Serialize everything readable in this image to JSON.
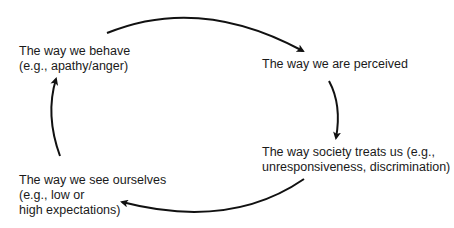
{
  "diagram": {
    "type": "cycle",
    "nodes": [
      {
        "id": "behave",
        "lines": [
          "The way we behave",
          "(e.g., apathy/anger)"
        ]
      },
      {
        "id": "perceived",
        "lines": [
          "The way we are perceived"
        ]
      },
      {
        "id": "society",
        "lines": [
          "The way society treats us (e.g.,",
          "unresponsiveness, discrimination)"
        ]
      },
      {
        "id": "self",
        "lines": [
          "The way we see ourselves",
          "(e.g., low or",
          "high expectations)"
        ]
      }
    ],
    "edges": [
      {
        "from": "behave",
        "to": "perceived"
      },
      {
        "from": "perceived",
        "to": "society"
      },
      {
        "from": "society",
        "to": "self"
      },
      {
        "from": "self",
        "to": "behave"
      }
    ],
    "colors": {
      "arrow": "#111111",
      "text": "#1a1a1a",
      "background": "#ffffff"
    }
  }
}
